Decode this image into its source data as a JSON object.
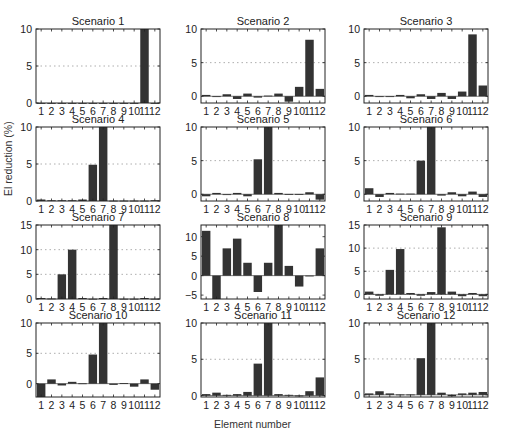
{
  "figure": {
    "ylabel": "El reduction (%)",
    "xlabel": "Element number"
  },
  "chart_data": [
    {
      "type": "bar",
      "title": "Scenario 1",
      "categories": [
        "1",
        "2",
        "3",
        "4",
        "5",
        "6",
        "7",
        "8",
        "9",
        "10",
        "11",
        "12"
      ],
      "values": [
        0,
        0,
        0,
        0,
        0,
        0,
        0,
        0,
        0,
        0,
        10,
        0
      ],
      "ylim": [
        0,
        10
      ],
      "yticks": [
        0,
        5,
        10
      ],
      "grid": "dotted-at-mid",
      "xlabel": "",
      "ylabel": ""
    },
    {
      "type": "bar",
      "title": "Scenario 2",
      "categories": [
        "1",
        "2",
        "3",
        "4",
        "5",
        "6",
        "7",
        "8",
        "9",
        "10",
        "11",
        "12"
      ],
      "values": [
        0.2,
        -0.1,
        0.3,
        -0.4,
        0.4,
        -0.2,
        0.1,
        0.4,
        -0.8,
        1.4,
        8.4,
        1.1
      ],
      "ylim": [
        -1,
        10
      ],
      "yticks": [
        0,
        5,
        10
      ],
      "grid": "dotted-at-mid"
    },
    {
      "type": "bar",
      "title": "Scenario 3",
      "categories": [
        "1",
        "2",
        "3",
        "4",
        "5",
        "6",
        "7",
        "8",
        "9",
        "10",
        "11",
        "12"
      ],
      "values": [
        0.2,
        -0.1,
        -0.1,
        0.2,
        -0.3,
        0.3,
        -0.4,
        0.5,
        -0.4,
        0.7,
        9.2,
        1.6
      ],
      "ylim": [
        -1,
        10
      ],
      "yticks": [
        0,
        5,
        10
      ],
      "grid": "dotted-at-mid"
    },
    {
      "type": "bar",
      "title": "Scenario 4",
      "categories": [
        "1",
        "2",
        "3",
        "4",
        "5",
        "6",
        "7",
        "8",
        "9",
        "10",
        "11",
        "12"
      ],
      "values": [
        0.2,
        0.1,
        0.1,
        0.1,
        0.2,
        4.9,
        10,
        0.05,
        0.05,
        0.05,
        0.05,
        0.1
      ],
      "ylim": [
        0,
        10
      ],
      "yticks": [
        0,
        5,
        10
      ],
      "grid": "dotted-at-mid"
    },
    {
      "type": "bar",
      "title": "Scenario 5",
      "categories": [
        "1",
        "2",
        "3",
        "4",
        "5",
        "6",
        "7",
        "8",
        "9",
        "10",
        "11",
        "12"
      ],
      "values": [
        -0.3,
        0.2,
        -0.1,
        0.2,
        -0.3,
        5.2,
        10,
        0.2,
        0.05,
        0.05,
        0.3,
        -0.8
      ],
      "ylim": [
        -1,
        10
      ],
      "yticks": [
        0,
        5,
        10
      ],
      "grid": "dotted-at-mid"
    },
    {
      "type": "bar",
      "title": "Scenario 6",
      "categories": [
        "1",
        "2",
        "3",
        "4",
        "5",
        "6",
        "7",
        "8",
        "9",
        "10",
        "11",
        "12"
      ],
      "values": [
        0.9,
        -0.4,
        0.2,
        0.1,
        0.1,
        5.0,
        10,
        -0.2,
        0.3,
        -0.3,
        0.4,
        -0.4
      ],
      "ylim": [
        -1,
        10
      ],
      "yticks": [
        0,
        5,
        10
      ],
      "grid": "dotted-at-mid"
    },
    {
      "type": "bar",
      "title": "Scenario 7",
      "categories": [
        "1",
        "2",
        "3",
        "4",
        "5",
        "6",
        "7",
        "8",
        "9",
        "10",
        "11",
        "12"
      ],
      "values": [
        0.2,
        0.1,
        5.0,
        10,
        0.2,
        0.05,
        0.2,
        15,
        0.05,
        0.05,
        0.2,
        0.05
      ],
      "ylim": [
        0,
        15
      ],
      "yticks": [
        0,
        5,
        10,
        15
      ],
      "grid": "dotted"
    },
    {
      "type": "bar",
      "title": "Scenario 8",
      "categories": [
        "1",
        "2",
        "3",
        "4",
        "5",
        "6",
        "7",
        "8",
        "9",
        "10",
        "11",
        "12"
      ],
      "values": [
        11.5,
        -6.0,
        7.0,
        9.5,
        3.3,
        -4.2,
        3.3,
        13.0,
        2.5,
        -2.8,
        0,
        7.0
      ],
      "ylim": [
        -6,
        13
      ],
      "yticks": [
        -5,
        0,
        5,
        10
      ],
      "grid": "none"
    },
    {
      "type": "bar",
      "title": "Scenario 9",
      "categories": [
        "1",
        "2",
        "3",
        "4",
        "5",
        "6",
        "7",
        "8",
        "9",
        "10",
        "11",
        "12"
      ],
      "values": [
        0.6,
        -0.3,
        5.3,
        9.8,
        0.3,
        -0.3,
        0.5,
        14.5,
        0.6,
        -0.4,
        0.3,
        -0.4
      ],
      "ylim": [
        -1,
        15
      ],
      "yticks": [
        0,
        5,
        10,
        15
      ],
      "grid": "dotted"
    },
    {
      "type": "bar",
      "title": "Scenario 10",
      "categories": [
        "1",
        "2",
        "3",
        "4",
        "5",
        "6",
        "7",
        "8",
        "9",
        "10",
        "11",
        "12"
      ],
      "values": [
        -2.2,
        0.7,
        -0.3,
        0.3,
        0.05,
        4.8,
        10,
        -0.2,
        0.1,
        -0.5,
        0.7,
        -1.0
      ],
      "ylim": [
        -2.2,
        10
      ],
      "yticks": [
        0,
        5,
        10
      ],
      "grid": "dotted-at-mid"
    },
    {
      "type": "bar",
      "title": "Scenario 11",
      "categories": [
        "1",
        "2",
        "3",
        "4",
        "5",
        "6",
        "7",
        "8",
        "9",
        "10",
        "11",
        "12"
      ],
      "values": [
        0.2,
        0.4,
        0.1,
        0.2,
        0.5,
        4.4,
        10,
        0.2,
        0.1,
        -0.1,
        0.6,
        2.5
      ],
      "ylim": [
        -0.2,
        10
      ],
      "yticks": [
        0,
        5,
        10
      ],
      "grid": "dotted-at-mid"
    },
    {
      "type": "bar",
      "title": "Scenario 12",
      "categories": [
        "1",
        "2",
        "3",
        "4",
        "5",
        "6",
        "7",
        "8",
        "9",
        "10",
        "11",
        "12"
      ],
      "values": [
        0.2,
        0.5,
        0.2,
        0.05,
        0.05,
        5.1,
        10,
        0.3,
        -0.2,
        0.2,
        0.3,
        0.4
      ],
      "ylim": [
        -0.3,
        10
      ],
      "yticks": [
        0,
        5,
        10
      ],
      "grid": "dotted-at-mid"
    }
  ],
  "style": {
    "bar_color": "#333333",
    "axis_color": "#222222",
    "grid_color": "#999999"
  }
}
